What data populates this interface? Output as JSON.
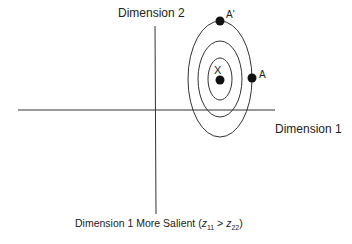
{
  "diagram": {
    "axes": {
      "x_label": "Dimension 1",
      "y_label": "Dimension 2"
    },
    "ideal_point": {
      "label": "X"
    },
    "points": [
      {
        "label": "A'"
      },
      {
        "label": "A"
      }
    ],
    "contours": 3,
    "caption": {
      "prefix": "Dimension 1 More Salient (",
      "z1": "z",
      "z1_sub": "11",
      "gt": " > ",
      "z2": "z",
      "z2_sub": "22",
      "suffix": ")"
    },
    "colors": {
      "line": "#333333",
      "point": "#111111",
      "background": "#ffffff"
    }
  }
}
